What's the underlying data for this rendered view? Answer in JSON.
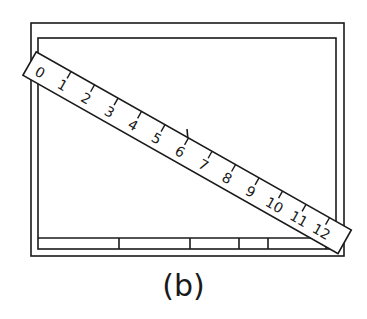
{
  "figure": {
    "caption": "(b)",
    "ruler": {
      "labels": [
        "0",
        "1",
        "2",
        "3",
        "4",
        "5",
        "6",
        "7",
        "8",
        "9",
        "10",
        "11",
        "12"
      ]
    },
    "colors": {
      "line": "#1a1a1a",
      "background": "#ffffff"
    }
  }
}
